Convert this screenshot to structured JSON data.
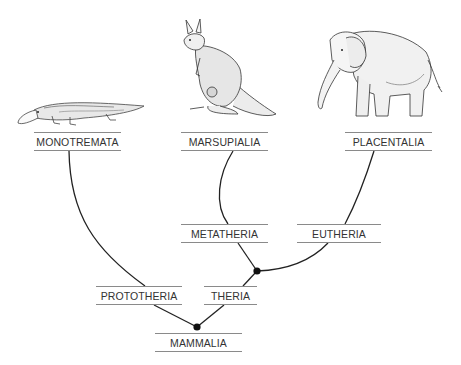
{
  "diagram": {
    "type": "phylogenetic-tree",
    "root": "MAMMALIA",
    "nodes": {
      "monotremata": "MONOTREMATA",
      "marsupialia": "MARSUPIALIA",
      "placentalia": "PLACENTALIA",
      "metatheria": "METATHERIA",
      "eutheria": "EUTHERIA",
      "prototheria": "PROTOTHERIA",
      "theria": "THERIA",
      "mammalia": "MAMMALIA"
    },
    "edges": [
      [
        "MAMMALIA",
        "PROTOTHERIA"
      ],
      [
        "MAMMALIA",
        "THERIA"
      ],
      [
        "PROTOTHERIA",
        "MONOTREMATA"
      ],
      [
        "THERIA",
        "METATHERIA"
      ],
      [
        "THERIA",
        "EUTHERIA"
      ],
      [
        "METATHERIA",
        "MARSUPIALIA"
      ],
      [
        "EUTHERIA",
        "PLACENTALIA"
      ]
    ],
    "illustrations": {
      "monotremata": "platypus",
      "marsupialia": "kangaroo",
      "placentalia": "elephant"
    },
    "colors": {
      "line": "#222222",
      "label_rule": "#8a8a8a",
      "label_text": "#333333",
      "node_dot": "#111111"
    }
  }
}
